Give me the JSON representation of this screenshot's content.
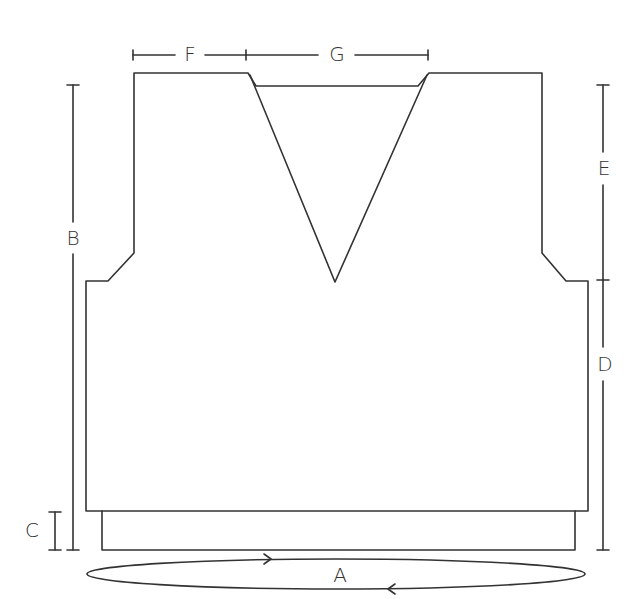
{
  "diagram": {
    "type": "knitting-schematic",
    "stroke_color": "#333333",
    "background": "#ffffff",
    "labels": {
      "A": "A",
      "B": "B",
      "C": "C",
      "D": "D",
      "E": "E",
      "F": "F",
      "G": "G"
    },
    "dimensions": [
      {
        "label": "A",
        "meaning": "circumference (worked in the round)",
        "orientation": "ellipse"
      },
      {
        "label": "B",
        "meaning": "total length",
        "orientation": "vertical-left"
      },
      {
        "label": "C",
        "meaning": "ribbing height",
        "orientation": "vertical-left"
      },
      {
        "label": "D",
        "meaning": "length to armhole",
        "orientation": "vertical-right"
      },
      {
        "label": "E",
        "meaning": "armhole depth",
        "orientation": "vertical-right"
      },
      {
        "label": "F",
        "meaning": "shoulder width",
        "orientation": "horizontal-top"
      },
      {
        "label": "G",
        "meaning": "neck width",
        "orientation": "horizontal-top"
      }
    ]
  }
}
